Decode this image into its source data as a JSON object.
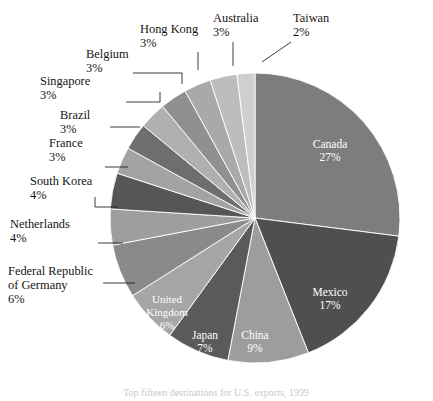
{
  "chart_data": {
    "type": "pie",
    "title": "",
    "subtitle": "",
    "caption": "Top fifteen destinations for U.S. exports, 1999",
    "legend_position": "labels",
    "units": "percent",
    "start_angle_deg": 0,
    "direction": "clockwise",
    "categories": [
      "Canada",
      "Mexico",
      "China",
      "Japan",
      "United Kingdom",
      "Federal Republic of Germany",
      "Netherlands",
      "South Korea",
      "France",
      "Brazil",
      "Singapore",
      "Belgium",
      "Hong Kong",
      "Australia",
      "Taiwan"
    ],
    "values": [
      27,
      17,
      9,
      7,
      6,
      6,
      4,
      4,
      3,
      3,
      3,
      3,
      3,
      3,
      2
    ],
    "value_labels": [
      "27%",
      "17%",
      "9%",
      "7%",
      "6%",
      "6%",
      "4%",
      "4%",
      "3%",
      "3%",
      "3%",
      "3%",
      "3%",
      "3%",
      "2%"
    ],
    "colors": [
      "#7d7d7d",
      "#4f4f4f",
      "#9d9d9d",
      "#5a5a5a",
      "#a6a6a6",
      "#8a8a8a",
      "#9e9e9e",
      "#565656",
      "#a3a3a3",
      "#6e6e6e",
      "#b0b0b0",
      "#909090",
      "#a9a9a9",
      "#bdbdbd",
      "#cfcfcf"
    ]
  },
  "slices": [
    {
      "name": "Canada",
      "label": "Canada",
      "pct_label": "27%",
      "value": 27,
      "color": "#7d7d7d",
      "label_mode": "inside"
    },
    {
      "name": "Mexico",
      "label": "Mexico",
      "pct_label": "17%",
      "value": 17,
      "color": "#4f4f4f",
      "label_mode": "inside"
    },
    {
      "name": "China",
      "label": "China",
      "pct_label": "9%",
      "value": 9,
      "color": "#9d9d9d",
      "label_mode": "inside"
    },
    {
      "name": "Japan",
      "label": "Japan",
      "pct_label": "7%",
      "value": 7,
      "color": "#5a5a5a",
      "label_mode": "inside"
    },
    {
      "name": "United Kingdom",
      "label": "United Kingdom",
      "pct_label": "6%",
      "value": 6,
      "color": "#a6a6a6",
      "label_mode": "inside"
    },
    {
      "name": "Federal Republic of Germany",
      "label": "Federal Republic of Germany",
      "pct_label": "6%",
      "value": 6,
      "color": "#8a8a8a",
      "label_mode": "outside"
    },
    {
      "name": "Netherlands",
      "label": "Netherlands",
      "pct_label": "4%",
      "value": 4,
      "color": "#9e9e9e",
      "label_mode": "outside"
    },
    {
      "name": "South Korea",
      "label": "South Korea",
      "pct_label": "4%",
      "value": 4,
      "color": "#565656",
      "label_mode": "outside"
    },
    {
      "name": "France",
      "label": "France",
      "pct_label": "3%",
      "value": 3,
      "color": "#a3a3a3",
      "label_mode": "outside"
    },
    {
      "name": "Brazil",
      "label": "Brazil",
      "pct_label": "3%",
      "value": 3,
      "color": "#6e6e6e",
      "label_mode": "outside"
    },
    {
      "name": "Singapore",
      "label": "Singapore",
      "pct_label": "3%",
      "value": 3,
      "color": "#b0b0b0",
      "label_mode": "outside"
    },
    {
      "name": "Belgium",
      "label": "Belgium",
      "pct_label": "3%",
      "value": 3,
      "color": "#909090",
      "label_mode": "outside"
    },
    {
      "name": "Hong Kong",
      "label": "Hong Kong",
      "pct_label": "3%",
      "value": 3,
      "color": "#a9a9a9",
      "label_mode": "outside"
    },
    {
      "name": "Australia",
      "label": "Australia",
      "pct_label": "3%",
      "value": 3,
      "color": "#bdbdbd",
      "label_mode": "outside"
    },
    {
      "name": "Taiwan",
      "label": "Taiwan",
      "pct_label": "2%",
      "value": 2,
      "color": "#cfcfcf",
      "label_mode": "outside"
    }
  ],
  "inside_labels": [
    {
      "key": "canada",
      "line1": "Canada",
      "line2": "27%",
      "x": 330,
      "y": 148
    },
    {
      "key": "mexico",
      "line1": "Mexico",
      "line2": "17%",
      "x": 330,
      "y": 296
    },
    {
      "key": "china",
      "line1": "China",
      "line2": "9%",
      "x": 255,
      "y": 339
    },
    {
      "key": "japan",
      "line1": "Japan",
      "line2": "7%",
      "x": 205,
      "y": 339
    },
    {
      "key": "uk_l1",
      "line1": "United",
      "line2": "Kingdom",
      "line3": "6%",
      "x": 167,
      "y": 303
    }
  ],
  "outer_labels": [
    {
      "key": "germany",
      "lines": [
        "Federal Republic",
        "of Germany",
        "6%"
      ],
      "x": 8,
      "y": 275,
      "align": "start"
    },
    {
      "key": "netherlands",
      "lines": [
        "Netherlands",
        "4%"
      ],
      "x": 10,
      "y": 228,
      "align": "start"
    },
    {
      "key": "south-korea",
      "lines": [
        "South Korea",
        "4%"
      ],
      "x": 30,
      "y": 185,
      "align": "start"
    },
    {
      "key": "france",
      "lines": [
        "France",
        "3%"
      ],
      "x": 49,
      "y": 147,
      "align": "start"
    },
    {
      "key": "brazil",
      "lines": [
        "Brazil",
        "3%"
      ],
      "x": 60,
      "y": 119,
      "align": "start"
    },
    {
      "key": "singapore",
      "lines": [
        "Singapore",
        "3%"
      ],
      "x": 40,
      "y": 85,
      "align": "start"
    },
    {
      "key": "belgium",
      "lines": [
        "Belgium",
        "3%"
      ],
      "x": 86,
      "y": 58,
      "align": "start"
    },
    {
      "key": "hong-kong",
      "lines": [
        "Hong Kong",
        "3%"
      ],
      "x": 140,
      "y": 33,
      "align": "start"
    },
    {
      "key": "australia",
      "lines": [
        "Australia",
        "3%"
      ],
      "x": 213,
      "y": 22,
      "align": "start"
    },
    {
      "key": "taiwan",
      "lines": [
        "Taiwan",
        "2%"
      ],
      "x": 293,
      "y": 22,
      "align": "start"
    }
  ],
  "caption": {
    "text": "Top fifteen destinations for U.S. exports, 1999",
    "x": 216,
    "y": 396
  }
}
